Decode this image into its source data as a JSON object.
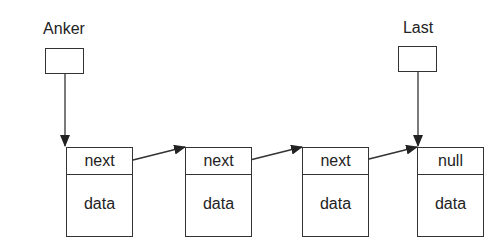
{
  "diagram": {
    "type": "singly-linked-list",
    "pointers": [
      {
        "label": "Anker",
        "points_to_node": 0
      },
      {
        "label": "Last",
        "points_to_node": 3
      }
    ],
    "nodes": [
      {
        "next_label": "next",
        "data_label": "data"
      },
      {
        "next_label": "next",
        "data_label": "data"
      },
      {
        "next_label": "next",
        "data_label": "data"
      },
      {
        "next_label": "null",
        "data_label": "data"
      }
    ],
    "colors": {
      "stroke": "#333333",
      "background": "#ffffff",
      "text": "#222222"
    }
  }
}
